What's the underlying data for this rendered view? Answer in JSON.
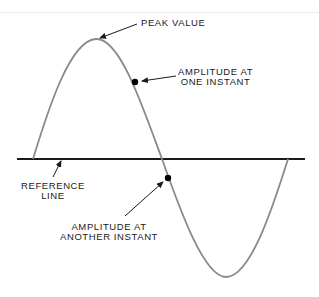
{
  "diagram": {
    "labels": {
      "peak": "PEAK VALUE",
      "amp_one_line1": "AMPLITUDE AT",
      "amp_one_line2": "ONE INSTANT",
      "reference_line1": "REFERENCE",
      "reference_line2": "LINE",
      "amp_another_line1": "AMPLITUDE AT",
      "amp_another_line2": "ANOTHER INSTANT"
    },
    "colors": {
      "wave": "#8a8a8a",
      "reference_line": "#1a1a1a",
      "dots": "#000000",
      "text": "#1a1a1a"
    }
  }
}
